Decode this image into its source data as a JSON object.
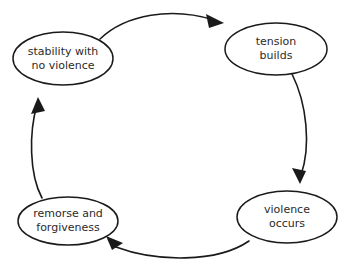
{
  "diagram": {
    "type": "cycle",
    "direction": "clockwise",
    "background_color": "#ffffff",
    "stroke_color": "#1a1a1a",
    "text_color": "#2b2b2b",
    "nodes": [
      {
        "id": "stability",
        "position": "top-left",
        "line1": "stability with",
        "line2": "no violence"
      },
      {
        "id": "tension",
        "position": "top-right",
        "line1": "tension",
        "line2": "builds"
      },
      {
        "id": "violence",
        "position": "bottom-right",
        "line1": "violence",
        "line2": "occurs"
      },
      {
        "id": "remorse",
        "position": "bottom-left",
        "line1": "remorse and",
        "line2": "forgiveness"
      }
    ],
    "edges": [
      {
        "id": "edge-top",
        "from": "stability",
        "to": "tension"
      },
      {
        "id": "edge-right",
        "from": "tension",
        "to": "violence"
      },
      {
        "id": "edge-bottom",
        "from": "violence",
        "to": "remorse"
      },
      {
        "id": "edge-left",
        "from": "remorse",
        "to": "stability"
      }
    ]
  }
}
